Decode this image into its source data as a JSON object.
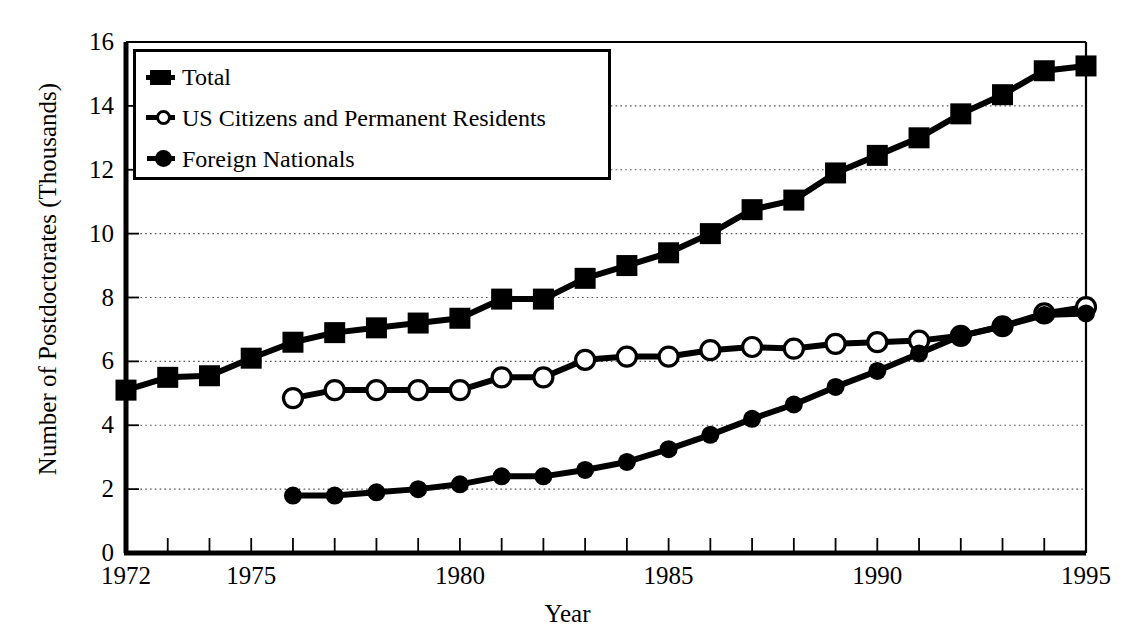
{
  "figure": {
    "title_partial": "",
    "background": "#ffffff",
    "ink_color": "#000000"
  },
  "axes": {
    "ylabel": "Number of Postdoctorates (Thousands)",
    "xlabel": "Year",
    "y_tick_labels": [
      "0",
      "2",
      "4",
      "6",
      "8",
      "10",
      "12",
      "14",
      "16"
    ],
    "x_tick_labels": [
      "1972",
      "1975",
      "1980",
      "1985",
      "1990",
      "1995"
    ]
  },
  "legend": {
    "items": [
      {
        "label": "Total",
        "marker": "filled-square"
      },
      {
        "label": "US Citizens and Permanent Residents",
        "marker": "open-circle"
      },
      {
        "label": "Foreign Nationals",
        "marker": "filled-circle"
      }
    ]
  },
  "chart_data": {
    "type": "line",
    "title": "",
    "xlabel": "Year",
    "ylabel": "Number of Postdoctorates (Thousands)",
    "xlim": [
      1972,
      1995
    ],
    "ylim": [
      0,
      16
    ],
    "yticks": [
      0,
      2,
      4,
      6,
      8,
      10,
      12,
      14,
      16
    ],
    "xticks": [
      1972,
      1975,
      1980,
      1985,
      1990,
      1995
    ],
    "xtick_labels_shown": [
      1972,
      1975,
      1980,
      1985,
      1990,
      1995
    ],
    "minor_xticks_every": 1,
    "grid": "horizontal-dotted",
    "legend_position": "upper-left-inside",
    "x": [
      1972,
      1973,
      1974,
      1975,
      1976,
      1977,
      1978,
      1979,
      1980,
      1981,
      1982,
      1983,
      1984,
      1985,
      1986,
      1987,
      1988,
      1989,
      1990,
      1991,
      1992,
      1993,
      1994,
      1995
    ],
    "series": [
      {
        "name": "Total",
        "marker": "filled-square",
        "x": [
          1972,
          1973,
          1974,
          1975,
          1976,
          1977,
          1978,
          1979,
          1980,
          1981,
          1982,
          1983,
          1984,
          1985,
          1986,
          1987,
          1988,
          1989,
          1990,
          1991,
          1992,
          1993,
          1994,
          1995
        ],
        "values": [
          5.1,
          5.5,
          5.55,
          6.1,
          6.6,
          6.9,
          7.05,
          7.2,
          7.35,
          7.95,
          7.95,
          8.6,
          9.0,
          9.4,
          10.0,
          10.75,
          11.05,
          11.9,
          12.45,
          13.0,
          13.75,
          14.35,
          15.1,
          15.25
        ]
      },
      {
        "name": "US Citizens and Permanent Residents",
        "marker": "open-circle",
        "x": [
          1976,
          1977,
          1978,
          1979,
          1980,
          1981,
          1982,
          1983,
          1984,
          1985,
          1986,
          1987,
          1988,
          1989,
          1990,
          1991,
          1992,
          1993,
          1994,
          1995
        ],
        "values": [
          4.85,
          5.1,
          5.1,
          5.1,
          5.1,
          5.5,
          5.5,
          6.05,
          6.15,
          6.15,
          6.35,
          6.45,
          6.4,
          6.55,
          6.6,
          6.65,
          6.8,
          7.1,
          7.5,
          7.7
        ]
      },
      {
        "name": "Foreign Nationals",
        "marker": "filled-circle",
        "x": [
          1976,
          1977,
          1978,
          1979,
          1980,
          1981,
          1982,
          1983,
          1984,
          1985,
          1986,
          1987,
          1988,
          1989,
          1990,
          1991,
          1992,
          1993,
          1994,
          1995
        ],
        "values": [
          1.8,
          1.8,
          1.9,
          2.0,
          2.15,
          2.4,
          2.4,
          2.6,
          2.85,
          3.25,
          3.7,
          4.2,
          4.65,
          5.2,
          5.7,
          6.25,
          6.8,
          7.1,
          7.45,
          7.5
        ]
      }
    ]
  }
}
